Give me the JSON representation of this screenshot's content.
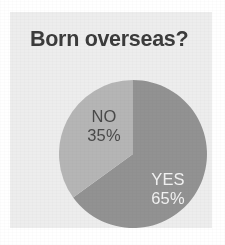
{
  "chart_data": {
    "type": "pie",
    "title": "Born overseas?",
    "categories": [
      "YES",
      "NO"
    ],
    "values": [
      65,
      35
    ],
    "value_unit": "%",
    "slices": [
      {
        "label": "YES",
        "value": 65,
        "value_text": "65%",
        "color": "#929292",
        "label_color": "#f2f2f2",
        "start_angle_deg": 0,
        "end_angle_deg": 234
      },
      {
        "label": "NO",
        "value": 35,
        "value_text": "35%",
        "color": "#b5b5b5",
        "label_color": "#4a4a4a",
        "start_angle_deg": 234,
        "end_angle_deg": 360
      }
    ],
    "start_angle_note": "first slice begins at 12 o'clock, drawn clockwise",
    "legend": "none (labels drawn inside slices)",
    "grid": false,
    "xlabel": "",
    "ylabel": ""
  },
  "panel": {
    "background_color": "#ededed",
    "page_background_color": "#ffffff"
  },
  "title": {
    "text": "Born overseas?",
    "color": "#3b3b3b"
  },
  "labels": {
    "no": {
      "name": "NO",
      "percent": "35%"
    },
    "yes": {
      "name": "YES",
      "percent": "65%"
    }
  }
}
